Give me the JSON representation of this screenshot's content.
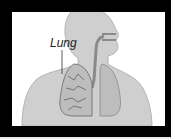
{
  "diagram": {
    "labels": [
      {
        "text": "Lung",
        "target": "left-lung"
      }
    ],
    "colors": {
      "frame": "#000000",
      "background": "#ffffff",
      "body": "#cfcfcf",
      "airway": "#8a8a8a",
      "lung": "#bdbdbd"
    }
  }
}
